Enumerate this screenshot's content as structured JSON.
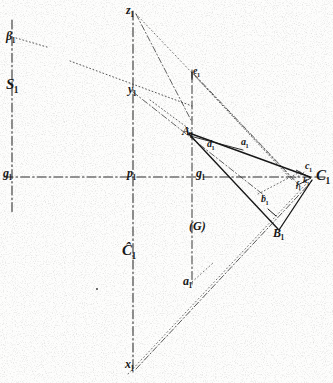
{
  "figure": {
    "caption_label": "(G)",
    "background_color": "#fdfdfc",
    "ink_color": "#1a1a1a",
    "labels": {
      "beta_1": "β",
      "S_1": "S",
      "g_1": "g",
      "z_1": "z",
      "p_1": "p",
      "C_script": "Ĉ",
      "x_1": "x",
      "e_1": "e",
      "A_1": "A",
      "d_1": "d",
      "a_small_1": "a",
      "g_right": "g",
      "b_1": "b",
      "B_1": "B",
      "c_1": "c",
      "C_1": "C",
      "a_1": "a",
      "y_mid": "y",
      "f_1": "f",
      "k_1": "k"
    },
    "subscripts": {
      "one": "1"
    },
    "line_styles": {
      "axis": "dash-dot",
      "construction": "dotted",
      "edge": "solid"
    }
  }
}
